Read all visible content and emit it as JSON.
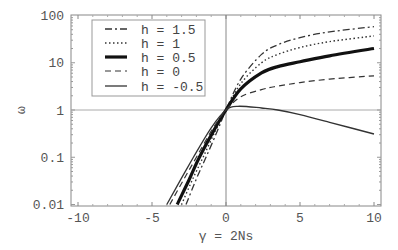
{
  "chart_data": {
    "type": "line",
    "title": "",
    "xlabel": "γ = 2Ns",
    "ylabel": "ω",
    "xlim": [
      -10,
      10
    ],
    "ylim": [
      0.01,
      100
    ],
    "yscale": "log",
    "grid": false,
    "reference_lines": {
      "x": 0,
      "y": 1
    },
    "x_ticks": [
      -10,
      -5,
      0,
      5,
      10
    ],
    "x_tick_labels": [
      "-10",
      "-5",
      "0",
      "5",
      "10"
    ],
    "y_ticks": [
      0.01,
      0.1,
      1,
      10,
      100
    ],
    "y_tick_labels": [
      "0.01",
      "0.1",
      "1",
      "10",
      "100"
    ],
    "legend_position": "upper-left",
    "series": [
      {
        "name": "h = 1.5",
        "style": "dash-dot",
        "x": [
          -2.7,
          -2.0,
          -1.35,
          -0.6,
          0,
          1,
          2.4,
          3.5,
          5,
          7,
          10
        ],
        "values": [
          0.01,
          0.035,
          0.1,
          0.35,
          1,
          4.5,
          15,
          24,
          34,
          45,
          58
        ]
      },
      {
        "name": "h = 1",
        "style": "dotted",
        "x": [
          -3.0,
          -2.3,
          -1.55,
          -0.7,
          0,
          1,
          2.4,
          3.5,
          5,
          7,
          10
        ],
        "values": [
          0.01,
          0.032,
          0.1,
          0.37,
          1,
          3.6,
          10,
          15,
          21,
          28,
          37
        ]
      },
      {
        "name": "h = 0.5",
        "style": "thick",
        "x": [
          -3.3,
          -2.5,
          -1.8,
          -0.8,
          0,
          1,
          2.4,
          3.5,
          5,
          7,
          10
        ],
        "values": [
          0.01,
          0.033,
          0.1,
          0.38,
          1,
          2.8,
          6.1,
          8.3,
          10.5,
          14,
          20
        ]
      },
      {
        "name": "h = 0",
        "style": "dashed",
        "x": [
          -3.8,
          -2.9,
          -2.0,
          -0.9,
          0,
          1,
          2.4,
          3.5,
          5,
          7,
          10
        ],
        "values": [
          0.01,
          0.032,
          0.1,
          0.4,
          1,
          1.9,
          2.7,
          3.2,
          3.8,
          4.5,
          5.3
        ]
      },
      {
        "name": "h = -0.5",
        "style": "solid",
        "x": [
          -4.0,
          -3.1,
          -2.2,
          -1.0,
          0,
          0.8,
          2.4,
          3.5,
          5,
          7,
          10
        ],
        "values": [
          0.01,
          0.032,
          0.1,
          0.42,
          1,
          1.2,
          1.1,
          1.0,
          0.8,
          0.55,
          0.31
        ]
      }
    ]
  }
}
